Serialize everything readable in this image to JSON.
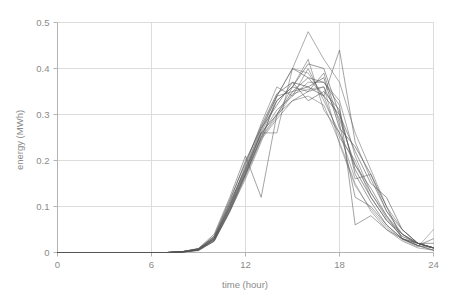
{
  "chart_data": {
    "type": "line",
    "title": "",
    "subtitle": "",
    "xlabel": "time (hour)",
    "ylabel": "energy (MWh)",
    "xlim": [
      0,
      24
    ],
    "ylim": [
      0,
      0.5
    ],
    "xticks": [
      0,
      6,
      12,
      18,
      24
    ],
    "yticks": [
      0,
      0.1,
      0.2,
      0.3,
      0.4,
      0.5
    ],
    "xtick_labels": [
      "0",
      "6",
      "12",
      "18",
      "24"
    ],
    "ytick_labels": [
      "0",
      "0.1",
      "0.2",
      "0.3",
      "0.4",
      "0.5"
    ],
    "grid": true,
    "grid_axis": "both",
    "legend": false,
    "legend_position": "none",
    "line_color": "#555555",
    "grid_color": "#dcdcdc",
    "axis_color": "#b4b4b4",
    "text_color": "#8a8a8a",
    "x": [
      0,
      1,
      2,
      3,
      4,
      5,
      6,
      7,
      8,
      9,
      10,
      11,
      12,
      13,
      14,
      15,
      16,
      17,
      18,
      19,
      20,
      21,
      22,
      23,
      24
    ],
    "series": [
      {
        "name": "day-01",
        "opacity": 0.55,
        "values": [
          0,
          0,
          0,
          0,
          0,
          0,
          0,
          0,
          0.002,
          0.006,
          0.03,
          0.1,
          0.18,
          0.26,
          0.26,
          0.4,
          0.48,
          0.42,
          0.37,
          0.26,
          0.18,
          0.1,
          0.05,
          0.02,
          0.01
        ]
      },
      {
        "name": "day-02",
        "opacity": 0.6,
        "values": [
          0,
          0,
          0,
          0,
          0,
          0,
          0,
          0,
          0.002,
          0.008,
          0.035,
          0.11,
          0.2,
          0.27,
          0.34,
          0.4,
          0.38,
          0.34,
          0.44,
          0.24,
          0.16,
          0.09,
          0.04,
          0.02,
          0.01
        ]
      },
      {
        "name": "day-03",
        "opacity": 0.65,
        "values": [
          0,
          0,
          0,
          0,
          0,
          0,
          0,
          0,
          0.001,
          0.005,
          0.025,
          0.09,
          0.17,
          0.25,
          0.33,
          0.36,
          0.41,
          0.4,
          0.3,
          0.22,
          0.15,
          0.12,
          0.05,
          0.02,
          0.02
        ]
      },
      {
        "name": "day-04",
        "opacity": 0.55,
        "values": [
          0,
          0,
          0,
          0,
          0,
          0,
          0,
          0,
          0.002,
          0.007,
          0.03,
          0.1,
          0.19,
          0.28,
          0.36,
          0.34,
          0.37,
          0.37,
          0.33,
          0.21,
          0.13,
          0.08,
          0.04,
          0.02,
          0.01
        ]
      },
      {
        "name": "day-05",
        "opacity": 0.7,
        "values": [
          0,
          0,
          0,
          0,
          0,
          0,
          0,
          0,
          0.001,
          0.006,
          0.028,
          0.095,
          0.175,
          0.26,
          0.3,
          0.35,
          0.36,
          0.38,
          0.27,
          0.23,
          0.17,
          0.1,
          0.03,
          0.015,
          0.01
        ]
      },
      {
        "name": "day-06",
        "opacity": 0.6,
        "values": [
          0,
          0,
          0,
          0,
          0,
          0,
          0,
          0,
          0.002,
          0.009,
          0.04,
          0.12,
          0.21,
          0.12,
          0.3,
          0.33,
          0.35,
          0.36,
          0.29,
          0.19,
          0.14,
          0.08,
          0.03,
          0.02,
          0.01
        ]
      },
      {
        "name": "day-07",
        "opacity": 0.5,
        "values": [
          0,
          0,
          0,
          0,
          0,
          0,
          0,
          0,
          0.001,
          0.005,
          0.026,
          0.09,
          0.16,
          0.24,
          0.34,
          0.4,
          0.39,
          0.34,
          0.25,
          0.2,
          0.12,
          0.07,
          0.04,
          0.015,
          0.005
        ]
      },
      {
        "name": "day-08",
        "opacity": 0.65,
        "values": [
          0,
          0,
          0,
          0,
          0,
          0,
          0,
          0,
          0.002,
          0.008,
          0.033,
          0.105,
          0.185,
          0.27,
          0.32,
          0.37,
          0.33,
          0.35,
          0.31,
          0.17,
          0.11,
          0.06,
          0.03,
          0.02,
          0.01
        ]
      },
      {
        "name": "day-09",
        "opacity": 0.55,
        "values": [
          0,
          0,
          0,
          0,
          0,
          0,
          0,
          0,
          0.001,
          0.006,
          0.029,
          0.098,
          0.172,
          0.255,
          0.31,
          0.34,
          0.4,
          0.33,
          0.26,
          0.16,
          0.17,
          0.09,
          0.05,
          0.02,
          0.01
        ]
      },
      {
        "name": "day-10",
        "opacity": 0.6,
        "values": [
          0,
          0,
          0,
          0,
          0,
          0,
          0,
          0,
          0.002,
          0.007,
          0.031,
          0.102,
          0.178,
          0.26,
          0.33,
          0.36,
          0.35,
          0.39,
          0.28,
          0.12,
          0.1,
          0.06,
          0.03,
          0.015,
          0.03
        ]
      },
      {
        "name": "day-11",
        "opacity": 0.5,
        "values": [
          0,
          0,
          0,
          0,
          0,
          0,
          0,
          0,
          0.001,
          0.004,
          0.024,
          0.088,
          0.165,
          0.245,
          0.29,
          0.33,
          0.34,
          0.32,
          0.24,
          0.15,
          0.09,
          0.05,
          0.025,
          0.01,
          0.005
        ]
      },
      {
        "name": "day-12",
        "opacity": 0.7,
        "values": [
          0,
          0,
          0,
          0,
          0,
          0,
          0,
          0,
          0.002,
          0.008,
          0.036,
          0.115,
          0.195,
          0.275,
          0.345,
          0.37,
          0.36,
          0.34,
          0.3,
          0.18,
          0.12,
          0.07,
          0.035,
          0.02,
          0.01
        ]
      },
      {
        "name": "day-13",
        "opacity": 0.55,
        "values": [
          0,
          0,
          0,
          0,
          0,
          0,
          0,
          0,
          0.001,
          0.006,
          0.027,
          0.094,
          0.17,
          0.25,
          0.3,
          0.36,
          0.42,
          0.31,
          0.26,
          0.19,
          0.13,
          0.075,
          0.04,
          0.02,
          0.01
        ]
      },
      {
        "name": "day-14",
        "opacity": 0.6,
        "values": [
          0,
          0,
          0,
          0,
          0,
          0,
          0,
          0,
          0.002,
          0.007,
          0.032,
          0.108,
          0.182,
          0.265,
          0.34,
          0.35,
          0.38,
          0.37,
          0.32,
          0.06,
          0.08,
          0.05,
          0.03,
          0.015,
          0.005
        ]
      },
      {
        "name": "day-15",
        "opacity": 0.45,
        "values": [
          0,
          0,
          0,
          0,
          0,
          0,
          0,
          0,
          0.001,
          0.005,
          0.025,
          0.092,
          0.168,
          0.248,
          0.295,
          0.345,
          0.355,
          0.36,
          0.235,
          0.145,
          0.095,
          0.055,
          0.028,
          0.012,
          0.05
        ]
      }
    ]
  }
}
